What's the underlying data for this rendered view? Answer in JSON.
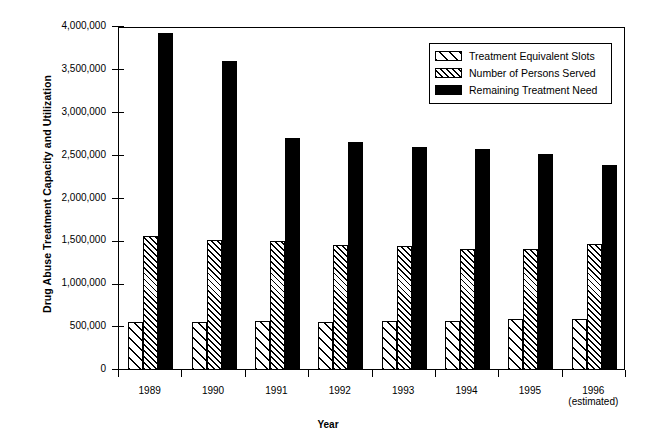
{
  "chart_data": {
    "type": "bar",
    "title": "",
    "xlabel": "Year",
    "ylabel": "Drug Abuse Treatment Capacity and Utilization",
    "ylim": [
      0,
      4000000
    ],
    "ytick_values": [
      0,
      500000,
      1000000,
      1500000,
      2000000,
      2500000,
      3000000,
      3500000,
      4000000
    ],
    "ytick_labels": [
      "0",
      "500,000",
      "1,000,000",
      "1,500,000",
      "2,000,000",
      "2,500,000",
      "3,000,000",
      "3,500,000",
      "4,000,000"
    ],
    "categories": [
      "1989",
      "1990",
      "1991",
      "1992",
      "1993",
      "1994",
      "1995",
      "1996"
    ],
    "category_sublabels": [
      "",
      "",
      "",
      "",
      "",
      "",
      "",
      "(estimated)"
    ],
    "grid": false,
    "legend_position": "top-right",
    "series": [
      {
        "name": "Treatment Equivalent Slots",
        "pattern": "hatch-sparse",
        "color": "#ffffff",
        "values": [
          560000,
          565000,
          575000,
          565000,
          575000,
          575000,
          600000,
          590000
        ]
      },
      {
        "name": "Number of Persons Served",
        "pattern": "hatch-dense",
        "color": "#ffffff",
        "values": [
          1560000,
          1520000,
          1500000,
          1460000,
          1450000,
          1415000,
          1415000,
          1470000
        ]
      },
      {
        "name": "Remaining Treatment Need",
        "pattern": "solid",
        "color": "#000000",
        "values": [
          3930000,
          3605000,
          2705000,
          2660000,
          2605000,
          2575000,
          2515000,
          2395000
        ]
      }
    ]
  },
  "legend": {
    "items": [
      {
        "label": "Treatment Equivalent Slots",
        "pattern": "hatch-sparse"
      },
      {
        "label": "Number of Persons Served",
        "pattern": "hatch-dense"
      },
      {
        "label": "Remaining Treatment Need",
        "pattern": "solid"
      }
    ]
  }
}
